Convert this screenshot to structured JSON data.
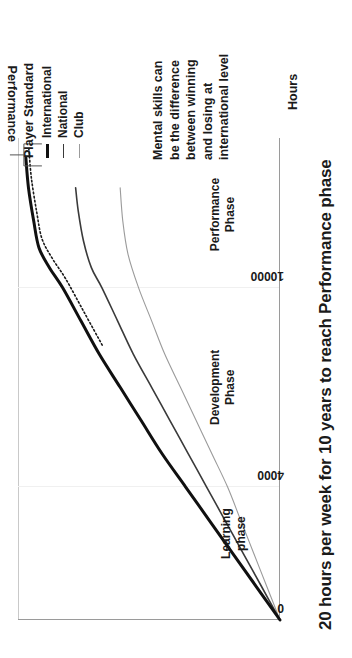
{
  "chart_data": {
    "type": "line",
    "title": "20 hours per week for 10 years to reach Performance phase",
    "xlabel": "Hours",
    "ylabel": "Performance",
    "xlim": [
      0,
      14500
    ],
    "ylim": [
      0,
      100
    ],
    "xticks": [
      "0",
      "4000",
      "10000"
    ],
    "xtick_values": [
      0,
      4000,
      10000
    ],
    "grid": true,
    "legend_title": "Player Standard",
    "legend_position": "top-right",
    "series": [
      {
        "name": "International",
        "color": "#101010",
        "width": 3,
        "x": [
          0,
          1000,
          2000,
          3000,
          4000,
          5000,
          6000,
          7000,
          8000,
          9000,
          10000,
          10600,
          11200,
          12000,
          13000,
          13900
        ],
        "y": [
          0,
          9,
          18,
          27,
          36,
          45,
          53,
          61,
          69,
          76,
          83,
          88,
          92,
          94,
          96,
          97
        ]
      },
      {
        "name": "National",
        "color": "#3a3a3a",
        "width": 1.6,
        "x": [
          0,
          1000,
          2000,
          3000,
          4000,
          5000,
          6000,
          7000,
          8000,
          9000,
          10000,
          10600,
          11400,
          12300,
          13000
        ],
        "y": [
          0,
          7,
          14,
          21,
          28,
          35,
          42,
          49,
          56,
          62,
          68,
          72,
          75,
          77,
          78
        ]
      },
      {
        "name": "Club",
        "color": "#9b9b9b",
        "width": 1.1,
        "x": [
          0,
          1000,
          2000,
          3000,
          4000,
          5000,
          6000,
          7000,
          8000,
          9000,
          10000,
          11000,
          12000,
          13000
        ],
        "y": [
          0,
          5,
          10,
          15,
          20,
          26,
          32,
          38,
          44,
          49,
          54,
          58,
          60,
          61
        ]
      }
    ],
    "annotations": [
      {
        "name": "learning-phase",
        "lines": [
          "Learning",
          "phase"
        ],
        "x_center": 2600,
        "y_center": 18
      },
      {
        "name": "development-phase",
        "lines": [
          "Development",
          "Phase"
        ],
        "x_center": 7000,
        "y_center": 22
      },
      {
        "name": "performance-phase",
        "lines": [
          "Performance",
          "Phase"
        ],
        "x_center": 12200,
        "y_center": 22
      }
    ],
    "callout": {
      "lines": [
        "Mental skills can",
        "be the difference",
        "between winning",
        "and losing at",
        "international level"
      ],
      "points_at_series": "International",
      "points_at_x": 13600
    }
  },
  "legend": {
    "title": "Player Standard",
    "items": [
      {
        "label": "International"
      },
      {
        "label": "National"
      },
      {
        "label": "Club"
      }
    ]
  },
  "axes": {
    "x_label": "Hours",
    "y_label": "Performance",
    "ticks": [
      {
        "label": "0"
      },
      {
        "label": "4000"
      },
      {
        "label": "10000"
      }
    ]
  },
  "title": "20 hours per week for 10 years to reach Performance phase"
}
